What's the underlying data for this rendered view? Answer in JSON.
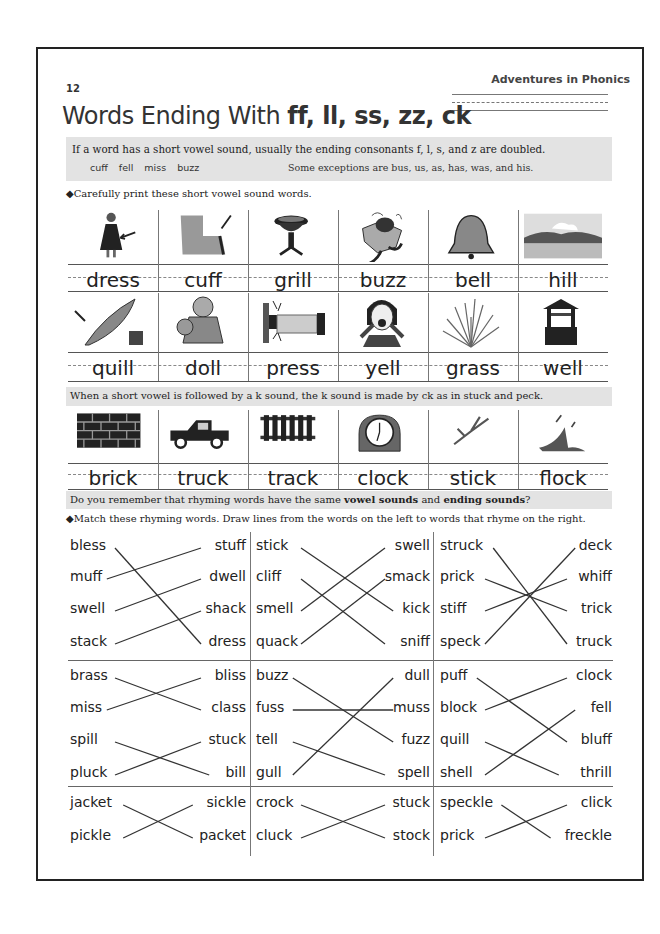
{
  "header": {
    "page_number": "12",
    "book_title": "Adventures in Phonics",
    "title_prefix": "Words Ending With ",
    "title_endings": "ff, ll, ss, zz, ck"
  },
  "rule_box": {
    "text": "If a word has a short vowel sound, usually the ending consonants f, l, s, and z are doubled.",
    "examples": [
      "cuff",
      "fell",
      "miss",
      "buzz"
    ],
    "exceptions": "Some exceptions are bus, us, as, has, was, and his."
  },
  "print_instruction": "◆Carefully print these short vowel sound words.",
  "picture_rows": [
    {
      "words": [
        {
          "word": "dress",
          "icon": "girl-dress-icon"
        },
        {
          "word": "cuff",
          "icon": "sleeve-cuff-icon"
        },
        {
          "word": "grill",
          "icon": "grill-icon"
        },
        {
          "word": "buzz",
          "icon": "bee-flower-icon"
        },
        {
          "word": "bell",
          "icon": "bell-icon"
        },
        {
          "word": "hill",
          "icon": "hill-landscape-icon"
        }
      ]
    },
    {
      "words": [
        {
          "word": "quill",
          "icon": "quill-ink-icon"
        },
        {
          "word": "doll",
          "icon": "doll-icon"
        },
        {
          "word": "press",
          "icon": "pressing-button-icon"
        },
        {
          "word": "yell",
          "icon": "yelling-woman-icon"
        },
        {
          "word": "grass",
          "icon": "grass-icon"
        },
        {
          "word": "well",
          "icon": "wishing-well-icon"
        }
      ]
    }
  ],
  "ck_rule": "When a short vowel is followed by a k sound, the k sound is made by ck as in stuck and peck.",
  "ck_row": [
    {
      "word": "brick",
      "icon": "brick-wall-icon"
    },
    {
      "word": "truck",
      "icon": "pickup-truck-icon"
    },
    {
      "word": "track",
      "icon": "railroad-track-icon"
    },
    {
      "word": "clock",
      "icon": "clock-icon"
    },
    {
      "word": "stick",
      "icon": "stick-icon"
    },
    {
      "word": "flock",
      "icon": "flock-of-birds-icon"
    }
  ],
  "rhyme_question": {
    "before": "Do you remember that rhyming words have the same ",
    "bold1": "vowel sounds",
    "middle": " and ",
    "bold2": "ending sounds",
    "after": "?"
  },
  "match_instruction": "◆Match these rhyming words. Draw lines from the words on the left to words that rhyme on the right.",
  "matching": [
    {
      "left": [
        "bless",
        "muff",
        "swell",
        "stack"
      ],
      "right": [
        "stuff",
        "dwell",
        "shack",
        "dress"
      ],
      "lines": [
        [
          0,
          3
        ],
        [
          1,
          0
        ],
        [
          2,
          1
        ],
        [
          3,
          2
        ]
      ]
    },
    {
      "left": [
        "stick",
        "cliff",
        "smell",
        "quack"
      ],
      "right": [
        "swell",
        "smack",
        "kick",
        "sniff"
      ],
      "lines": [
        [
          0,
          2
        ],
        [
          1,
          3
        ],
        [
          2,
          0
        ],
        [
          3,
          1
        ]
      ]
    },
    {
      "left": [
        "struck",
        "prick",
        "stiff",
        "speck"
      ],
      "right": [
        "deck",
        "whiff",
        "trick",
        "truck"
      ],
      "lines": [
        [
          0,
          3
        ],
        [
          1,
          2
        ],
        [
          2,
          1
        ],
        [
          3,
          0
        ]
      ]
    },
    {
      "left": [
        "brass",
        "miss",
        "spill",
        "pluck"
      ],
      "right": [
        "bliss",
        "class",
        "stuck",
        "bill"
      ],
      "lines": [
        [
          0,
          1
        ],
        [
          1,
          0
        ],
        [
          2,
          3
        ],
        [
          3,
          2
        ]
      ]
    },
    {
      "left": [
        "buzz",
        "fuss",
        "tell",
        "gull"
      ],
      "right": [
        "dull",
        "muss",
        "fuzz",
        "spell"
      ],
      "lines": [
        [
          0,
          2
        ],
        [
          1,
          1
        ],
        [
          2,
          3
        ],
        [
          3,
          0
        ]
      ]
    },
    {
      "left": [
        "puff",
        "block",
        "quill",
        "shell"
      ],
      "right": [
        "clock",
        "fell",
        "bluff",
        "thrill"
      ],
      "lines": [
        [
          0,
          2
        ],
        [
          1,
          0
        ],
        [
          2,
          3
        ],
        [
          3,
          1
        ]
      ]
    },
    {
      "left": [
        "jacket",
        "pickle"
      ],
      "right": [
        "sickle",
        "packet"
      ],
      "lines": [
        [
          0,
          1
        ],
        [
          1,
          0
        ]
      ]
    },
    {
      "left": [
        "crock",
        "cluck"
      ],
      "right": [
        "stuck",
        "stock"
      ],
      "lines": [
        [
          0,
          1
        ],
        [
          1,
          0
        ]
      ]
    },
    {
      "left": [
        "speckle",
        "prick"
      ],
      "right": [
        "click",
        "freckle"
      ],
      "lines": [
        [
          0,
          1
        ],
        [
          1,
          0
        ]
      ]
    }
  ]
}
